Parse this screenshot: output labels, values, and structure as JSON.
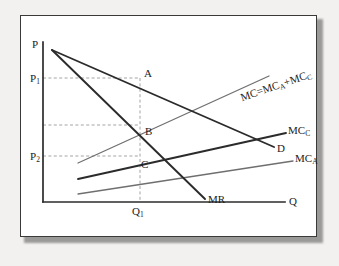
{
  "figure": {
    "title": "",
    "axes": {
      "y_axis_top_label": "P",
      "x_axis_right_label": "Q",
      "x_tick_label": "Q1",
      "x_tick_label_sub": "1",
      "y_tick_labels": [
        {
          "base": "P",
          "sub": "1"
        },
        {
          "base": "P",
          "sub": "2"
        }
      ]
    },
    "points": [
      {
        "name": "A",
        "label": "A"
      },
      {
        "name": "B",
        "label": "B"
      },
      {
        "name": "C",
        "label": "C"
      }
    ],
    "curves": [
      {
        "name": "demand",
        "label": "D"
      },
      {
        "name": "marginal-revenue",
        "label": "MR"
      },
      {
        "name": "marginal-cost-total",
        "label_parts": {
          "lead": "MC=MC",
          "sub1": "A",
          "plus": "+MC",
          "sub2": "C"
        }
      },
      {
        "name": "marginal-cost-c",
        "label_base": "MC",
        "label_sub": "C"
      },
      {
        "name": "marginal-cost-a",
        "label_base": "MC",
        "label_sub": "A"
      }
    ],
    "colors": {
      "dark_line": "#2b2b2b",
      "gray_line": "#6f6f6f",
      "dashed_line": "#9a9a9a",
      "frame_border": "#3a3a3a",
      "page_background": "#f2f1ef",
      "plot_background": "#ffffff",
      "text": "#1c1c1c"
    }
  },
  "chart_data": {
    "type": "line",
    "xlabel": "Q",
    "ylabel": "P",
    "xlim": [
      0,
      100
    ],
    "ylim": [
      0,
      100
    ],
    "grid": false,
    "legend": "inline-curve-labels",
    "x_ticks": [
      {
        "value": 38,
        "label": "Q1"
      }
    ],
    "y_ticks": [
      {
        "value": 74,
        "label": "P1"
      },
      {
        "value": 53,
        "label": ""
      },
      {
        "value": 31,
        "label": "P2"
      }
    ],
    "annotations": [
      {
        "label": "A",
        "x": 38,
        "y": 74,
        "note": "Demand at Q1 (price level P1)"
      },
      {
        "label": "B",
        "x": 38,
        "y": 53,
        "note": "MR = total MC intersection"
      },
      {
        "label": "C",
        "x": 38,
        "y": 31,
        "note": "MC_C at Q1 (price level P2)"
      }
    ],
    "series": [
      {
        "name": "D",
        "label": "D",
        "type": "line",
        "style": "solid",
        "color": "#2b2b2b",
        "points": [
          {
            "x": 2,
            "y": 96
          },
          {
            "x": 86,
            "y": 39
          }
        ]
      },
      {
        "name": "MR",
        "label": "MR",
        "type": "line",
        "style": "solid",
        "color": "#2b2b2b",
        "points": [
          {
            "x": 2,
            "y": 96
          },
          {
            "x": 61,
            "y": 17
          }
        ]
      },
      {
        "name": "MC=MC_A+MC_C",
        "label": "MC=MC_A+MC_C",
        "type": "line",
        "style": "solid",
        "color": "#6f6f6f",
        "points": [
          {
            "x": 12,
            "y": 33
          },
          {
            "x": 83,
            "y": 73
          }
        ]
      },
      {
        "name": "MC_C",
        "label": "MC_C",
        "type": "line",
        "style": "solid",
        "color": "#2b2b2b",
        "points": [
          {
            "x": 12,
            "y": 23
          },
          {
            "x": 90,
            "y": 52
          }
        ]
      },
      {
        "name": "MC_A",
        "label": "MC_A",
        "type": "line",
        "style": "solid",
        "color": "#6f6f6f",
        "points": [
          {
            "x": 12,
            "y": 14
          },
          {
            "x": 93,
            "y": 34
          }
        ]
      }
    ],
    "reference_lines": [
      {
        "orientation": "horizontal",
        "y": 74,
        "style": "dashed",
        "from_x": 0,
        "to_x": 38
      },
      {
        "orientation": "horizontal",
        "y": 53,
        "style": "dashed",
        "from_x": 0,
        "to_x": 38
      },
      {
        "orientation": "horizontal",
        "y": 31,
        "style": "dashed",
        "from_x": 0,
        "to_x": 38
      },
      {
        "orientation": "vertical",
        "x": 38,
        "style": "dashed",
        "from_y": 0,
        "to_y": 74
      }
    ]
  }
}
